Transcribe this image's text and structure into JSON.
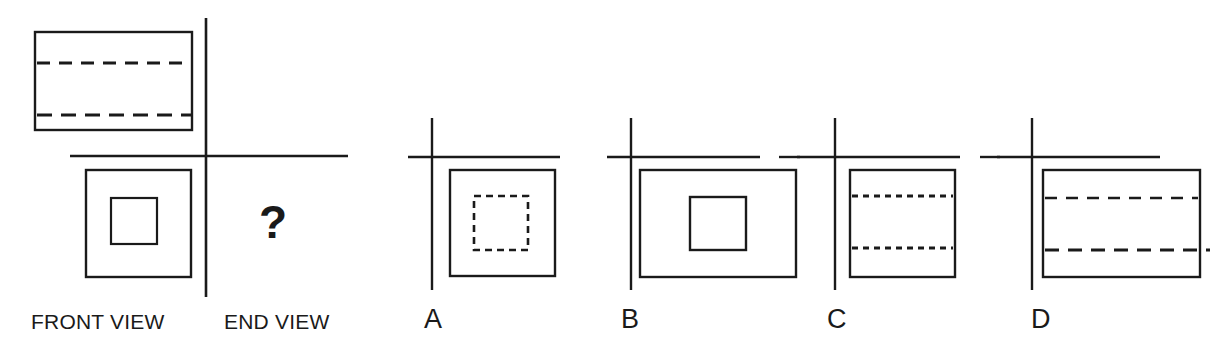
{
  "figure": {
    "kind": "orthographic-projection-multiple-choice",
    "stroke_color": "#1a1a1a",
    "background_color": "#ffffff",
    "question_mark": "?",
    "given_views": {
      "front_view_label": "FRONT VIEW",
      "end_view_label": "END VIEW",
      "front_view": {
        "outline": "rectangle",
        "hidden_lines": [
          "horizontal dashed",
          "horizontal dashed"
        ]
      },
      "top_view": {
        "outline": "square",
        "inner": "solid square"
      }
    },
    "options": [
      {
        "letter": "A",
        "outline": "square",
        "inner": "dashed square"
      },
      {
        "letter": "B",
        "outline": "rectangle",
        "inner": "solid square"
      },
      {
        "letter": "C",
        "outline": "square",
        "inner": "two dotted horizontal lines"
      },
      {
        "letter": "D",
        "outline": "rectangle",
        "inner": "two dashed horizontal lines"
      }
    ]
  }
}
